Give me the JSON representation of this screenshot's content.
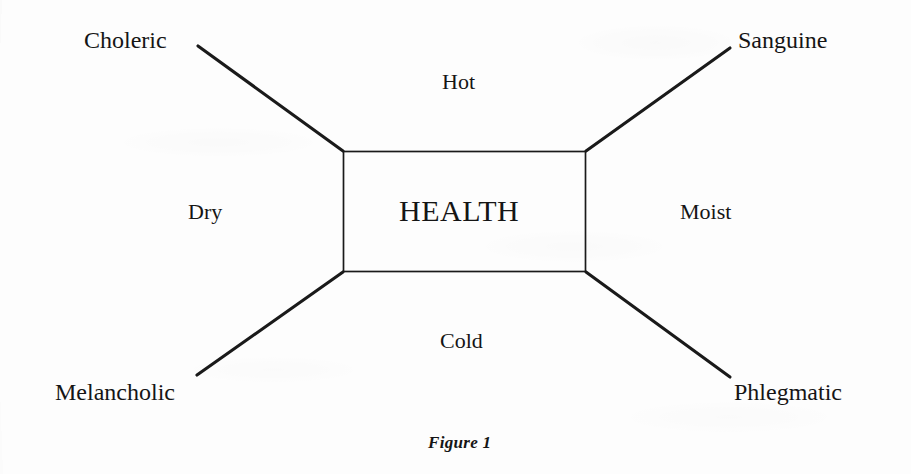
{
  "figure": {
    "caption": "Figure 1",
    "center_label": "HEALTH",
    "corner_labels": {
      "top_left": "Choleric",
      "top_right": "Sanguine",
      "bottom_left": "Melancholic",
      "bottom_right": "Phlegmatic"
    },
    "axis_labels": {
      "top": "Hot",
      "right": "Moist",
      "bottom": "Cold",
      "left": "Dry"
    },
    "colors": {
      "ink": "#151515",
      "line": "#1a1a1a",
      "paper": "#fdfdfd"
    }
  }
}
